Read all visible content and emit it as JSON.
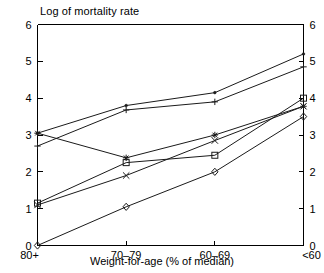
{
  "chart_data": {
    "type": "line",
    "title": "Log of mortality rate",
    "xlabel": "Weight-for-age (% of median)",
    "ylabel": "",
    "categories": [
      "80+",
      "70–79",
      "60–69",
      "<60"
    ],
    "ylim": [
      0,
      6
    ],
    "y_ticks": [
      0,
      1,
      2,
      3,
      4,
      5,
      6
    ],
    "y_ticklabels": [
      "0",
      "1",
      "2",
      "3",
      "4",
      "5",
      "6"
    ],
    "right_axis": true,
    "right_y_ticks": [
      0,
      1,
      2,
      3,
      4,
      5,
      6
    ],
    "right_y_ticklabels": [
      "0",
      "1",
      "2",
      "3",
      "4",
      "5",
      "6"
    ],
    "grid": false,
    "legend": "none",
    "series": [
      {
        "name": "series-1",
        "marker": "point",
        "values": [
          3.05,
          3.8,
          4.15,
          5.2
        ]
      },
      {
        "name": "series-2",
        "marker": "plus",
        "values": [
          2.7,
          3.68,
          3.9,
          4.85
        ]
      },
      {
        "name": "series-3",
        "marker": "star",
        "values": [
          3.05,
          2.38,
          3.0,
          3.78
        ]
      },
      {
        "name": "series-4",
        "marker": "cross",
        "values": [
          1.1,
          1.9,
          2.85,
          3.78
        ]
      },
      {
        "name": "series-5",
        "marker": "square",
        "values": [
          1.15,
          2.25,
          2.45,
          4.0
        ]
      },
      {
        "name": "series-6",
        "marker": "diamond",
        "values": [
          0.0,
          1.05,
          2.0,
          3.5
        ]
      }
    ]
  },
  "colors": {
    "axis": "#000000",
    "line": "#1a1a1a",
    "background": "#ffffff"
  }
}
